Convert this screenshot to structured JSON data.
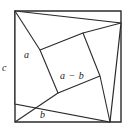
{
  "figure": {
    "stroke_color": "#2b2b2b",
    "fill_color": "#ffffff",
    "background_color": "#ffffff",
    "labels": {
      "c": "c",
      "a": "a",
      "b": "b",
      "a_minus_b": "a − b"
    },
    "geometry": {
      "outer_square": {
        "name": "outer-square",
        "points": "15,11 121,11 121,122 15,122"
      },
      "tilted_square": {
        "name": "tilted-square-c",
        "points": "15,11 121,23 110,122 15,104"
      },
      "inner_square": {
        "name": "inner-square-a-minus-b",
        "points": "40,50 83,33 100,76 58,93"
      },
      "segments": [
        {
          "name": "segment-a-left",
          "x1": 15,
          "y1": 11,
          "x2": 40,
          "y2": 50
        },
        {
          "name": "segment-b-bottom",
          "x1": 15,
          "y1": 122,
          "x2": 58,
          "y2": 93
        },
        {
          "name": "segment-top-right",
          "x1": 83,
          "y1": 33,
          "x2": 121,
          "y2": 23
        },
        {
          "name": "segment-right-side",
          "x1": 100,
          "y1": 76,
          "x2": 110,
          "y2": 122
        }
      ]
    }
  }
}
